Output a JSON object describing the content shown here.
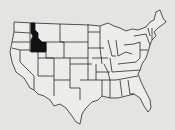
{
  "map": {
    "subject": "United States map",
    "highlighted_state": "Idaho",
    "colors": {
      "background": "#e4e4e2",
      "state_fill": "#ececea",
      "border": "#2a2a2a",
      "highlight": "#111111"
    }
  }
}
